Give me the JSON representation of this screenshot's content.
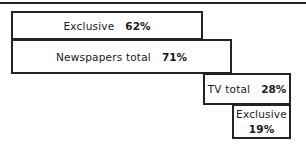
{
  "chart_data": {
    "type": "bar",
    "title": "",
    "subtitle": "",
    "xlabel": "",
    "ylabel": "",
    "orientation": "horizontal",
    "grid": false,
    "legend": "none",
    "xlim": [
      0,
      100
    ],
    "units": "percent",
    "categories": [
      "Exclusive",
      "Newspapers total",
      "TV total",
      "Exclusive"
    ],
    "values": [
      62,
      71,
      28,
      19
    ],
    "value_labels": [
      "62%",
      "71%",
      "28%",
      "19%"
    ],
    "bars": [
      {
        "id": "newspapers-exclusive",
        "label": "Exclusive",
        "value": 62,
        "value_label": "62%",
        "group": "Newspapers"
      },
      {
        "id": "newspapers-total",
        "label": "Newspapers total",
        "value": 71,
        "value_label": "71%",
        "group": "Newspapers"
      },
      {
        "id": "tv-total",
        "label": "TV total",
        "value": 28,
        "value_label": "28%",
        "group": "TV"
      },
      {
        "id": "tv-exclusive",
        "label": "Exclusive",
        "value": 19,
        "value_label": "19%",
        "group": "TV"
      }
    ]
  },
  "colors": {
    "stroke": "#232323",
    "background": "#ffffff",
    "text": "#1a1a1a"
  }
}
